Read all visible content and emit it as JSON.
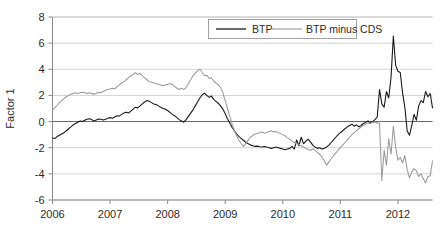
{
  "chart_data": {
    "type": "line",
    "title": "",
    "xlabel": "",
    "ylabel": "Factor 1",
    "xlim": [
      2006.0,
      2012.6
    ],
    "ylim": [
      -6,
      8
    ],
    "yticks": [
      8,
      6,
      4,
      2,
      0,
      -2,
      -4,
      -6
    ],
    "ytick_labels": [
      "8",
      "6",
      "4",
      "2",
      "0",
      "-2",
      "-4",
      "-6"
    ],
    "xticks": [
      2006,
      2007,
      2008,
      2009,
      2010,
      2011,
      2012
    ],
    "xtick_labels": [
      "2006",
      "2007",
      "2008",
      "2009",
      "2010",
      "2011",
      "2012"
    ],
    "grid": true,
    "grid_axis": "y",
    "zero_line": true,
    "legend_position": "upper center",
    "series": [
      {
        "name": "BTP",
        "color": "#1a1a1a",
        "x": [
          2006.0,
          2006.04,
          2006.08,
          2006.12,
          2006.16,
          2006.2,
          2006.24,
          2006.28,
          2006.32,
          2006.36,
          2006.4,
          2006.44,
          2006.48,
          2006.52,
          2006.56,
          2006.6,
          2006.64,
          2006.68,
          2006.72,
          2006.76,
          2006.8,
          2006.84,
          2006.88,
          2006.92,
          2006.96,
          2007.0,
          2007.04,
          2007.08,
          2007.12,
          2007.16,
          2007.2,
          2007.24,
          2007.28,
          2007.32,
          2007.36,
          2007.4,
          2007.44,
          2007.48,
          2007.52,
          2007.56,
          2007.6,
          2007.64,
          2007.68,
          2007.72,
          2007.76,
          2007.8,
          2007.84,
          2007.88,
          2007.92,
          2007.96,
          2008.0,
          2008.04,
          2008.08,
          2008.12,
          2008.16,
          2008.2,
          2008.24,
          2008.28,
          2008.32,
          2008.36,
          2008.4,
          2008.44,
          2008.48,
          2008.52,
          2008.56,
          2008.6,
          2008.64,
          2008.68,
          2008.72,
          2008.76,
          2008.8,
          2008.84,
          2008.88,
          2008.92,
          2008.96,
          2009.0,
          2009.04,
          2009.08,
          2009.12,
          2009.16,
          2009.2,
          2009.24,
          2009.28,
          2009.32,
          2009.36,
          2009.4,
          2009.44,
          2009.48,
          2009.52,
          2009.56,
          2009.6,
          2009.64,
          2009.68,
          2009.72,
          2009.76,
          2009.8,
          2009.84,
          2009.88,
          2009.92,
          2009.96,
          2010.0,
          2010.04,
          2010.08,
          2010.12,
          2010.16,
          2010.2,
          2010.24,
          2010.28,
          2010.32,
          2010.36,
          2010.4,
          2010.44,
          2010.48,
          2010.52,
          2010.56,
          2010.6,
          2010.64,
          2010.68,
          2010.72,
          2010.76,
          2010.8,
          2010.84,
          2010.88,
          2010.92,
          2010.96,
          2011.0,
          2011.04,
          2011.08,
          2011.12,
          2011.16,
          2011.2,
          2011.24,
          2011.28,
          2011.32,
          2011.36,
          2011.4,
          2011.44,
          2011.48,
          2011.52,
          2011.56,
          2011.6,
          2011.64,
          2011.68,
          2011.72,
          2011.76,
          2011.8,
          2011.84,
          2011.88,
          2011.92,
          2011.96,
          2012.0,
          2012.04,
          2012.08,
          2012.12,
          2012.16,
          2012.2,
          2012.24,
          2012.28,
          2012.32,
          2012.36,
          2012.4,
          2012.44,
          2012.48,
          2012.52,
          2012.56,
          2012.6
        ],
        "y": [
          -1.25,
          -1.3,
          -1.15,
          -1.05,
          -0.95,
          -0.85,
          -0.7,
          -0.55,
          -0.4,
          -0.25,
          -0.15,
          -0.05,
          0.05,
          0.0,
          0.1,
          0.18,
          0.22,
          0.15,
          0.05,
          0.12,
          0.2,
          0.18,
          0.12,
          0.18,
          0.25,
          0.3,
          0.25,
          0.35,
          0.45,
          0.42,
          0.55,
          0.65,
          0.72,
          0.65,
          0.8,
          0.95,
          1.1,
          1.05,
          1.2,
          1.35,
          1.5,
          1.62,
          1.55,
          1.45,
          1.35,
          1.3,
          1.2,
          1.1,
          1.0,
          0.95,
          0.85,
          0.7,
          0.55,
          0.45,
          0.3,
          0.15,
          0.05,
          -0.05,
          0.15,
          0.4,
          0.65,
          0.9,
          1.2,
          1.5,
          1.8,
          2.05,
          2.18,
          2.0,
          1.85,
          1.95,
          1.7,
          1.55,
          1.4,
          1.2,
          0.95,
          0.6,
          0.2,
          -0.1,
          -0.45,
          -0.7,
          -0.95,
          -1.15,
          -1.3,
          -1.45,
          -1.6,
          -1.7,
          -1.8,
          -1.85,
          -1.9,
          -1.88,
          -1.92,
          -1.95,
          -1.9,
          -1.95,
          -2.0,
          -2.05,
          -2.0,
          -1.95,
          -2.0,
          -2.05,
          -2.1,
          -2.15,
          -2.1,
          -2.05,
          -1.9,
          -2.1,
          -1.4,
          -1.85,
          -1.2,
          -1.7,
          -1.5,
          -1.35,
          -1.55,
          -1.8,
          -1.95,
          -2.05,
          -2.0,
          -2.1,
          -2.05,
          -1.95,
          -1.8,
          -1.6,
          -1.4,
          -1.2,
          -1.0,
          -0.85,
          -0.7,
          -0.55,
          -0.4,
          -0.3,
          -0.2,
          -0.35,
          -0.25,
          -0.4,
          -0.3,
          -0.15,
          -0.05,
          0.05,
          -0.1,
          0.0,
          0.15,
          0.35,
          2.45,
          1.35,
          1.1,
          2.3,
          1.8,
          3.4,
          6.55,
          4.3,
          3.85,
          3.75,
          2.2,
          1.1,
          -0.7,
          -1.05,
          -0.3,
          0.55,
          0.1,
          1.2,
          1.6,
          1.45,
          2.3,
          1.9,
          2.15,
          1.05
        ]
      },
      {
        "name": "BTP minus CDS",
        "color": "#9a9a9a",
        "x": [
          2006.0,
          2006.04,
          2006.08,
          2006.12,
          2006.16,
          2006.2,
          2006.24,
          2006.28,
          2006.32,
          2006.36,
          2006.4,
          2006.44,
          2006.48,
          2006.52,
          2006.56,
          2006.6,
          2006.64,
          2006.68,
          2006.72,
          2006.76,
          2006.8,
          2006.84,
          2006.88,
          2006.92,
          2006.96,
          2007.0,
          2007.04,
          2007.08,
          2007.12,
          2007.16,
          2007.2,
          2007.24,
          2007.28,
          2007.32,
          2007.36,
          2007.4,
          2007.44,
          2007.48,
          2007.52,
          2007.56,
          2007.6,
          2007.64,
          2007.68,
          2007.72,
          2007.76,
          2007.8,
          2007.84,
          2007.88,
          2007.92,
          2007.96,
          2008.0,
          2008.04,
          2008.08,
          2008.12,
          2008.16,
          2008.2,
          2008.24,
          2008.28,
          2008.32,
          2008.36,
          2008.4,
          2008.44,
          2008.48,
          2008.52,
          2008.56,
          2008.6,
          2008.64,
          2008.68,
          2008.72,
          2008.76,
          2008.8,
          2008.84,
          2008.88,
          2008.92,
          2008.96,
          2009.0,
          2009.04,
          2009.08,
          2009.12,
          2009.16,
          2009.2,
          2009.24,
          2009.28,
          2009.32,
          2009.36,
          2009.4,
          2009.44,
          2009.48,
          2009.52,
          2009.56,
          2009.6,
          2009.64,
          2009.68,
          2009.72,
          2009.76,
          2009.8,
          2009.84,
          2009.88,
          2009.92,
          2009.96,
          2010.0,
          2010.04,
          2010.08,
          2010.12,
          2010.16,
          2010.2,
          2010.24,
          2010.28,
          2010.32,
          2010.36,
          2010.4,
          2010.44,
          2010.48,
          2010.52,
          2010.56,
          2010.6,
          2010.64,
          2010.68,
          2010.72,
          2010.76,
          2010.8,
          2010.84,
          2010.88,
          2010.92,
          2010.96,
          2011.0,
          2011.04,
          2011.08,
          2011.12,
          2011.16,
          2011.2,
          2011.24,
          2011.28,
          2011.32,
          2011.36,
          2011.4,
          2011.44,
          2011.48,
          2011.52,
          2011.56,
          2011.6,
          2011.64,
          2011.68,
          2011.72,
          2011.76,
          2011.8,
          2011.84,
          2011.88,
          2011.92,
          2011.96,
          2012.0,
          2012.04,
          2012.08,
          2012.12,
          2012.16,
          2012.2,
          2012.24,
          2012.28,
          2012.32,
          2012.36,
          2012.4,
          2012.44,
          2012.48,
          2012.52,
          2012.56,
          2012.6
        ],
        "y": [
          0.9,
          1.05,
          1.25,
          1.45,
          1.6,
          1.75,
          1.9,
          2.0,
          2.1,
          2.15,
          2.2,
          2.15,
          2.2,
          2.25,
          2.2,
          2.15,
          2.2,
          2.15,
          2.1,
          2.15,
          2.25,
          2.2,
          2.3,
          2.4,
          2.45,
          2.5,
          2.55,
          2.5,
          2.65,
          2.8,
          2.95,
          3.05,
          3.2,
          3.35,
          3.5,
          3.6,
          3.75,
          3.6,
          3.7,
          3.5,
          3.35,
          3.2,
          3.05,
          3.0,
          2.95,
          2.9,
          2.85,
          2.8,
          2.75,
          2.8,
          2.85,
          2.9,
          2.85,
          2.7,
          2.55,
          2.45,
          2.55,
          2.45,
          2.6,
          2.9,
          3.2,
          3.5,
          3.7,
          3.9,
          4.0,
          3.75,
          3.5,
          3.55,
          3.3,
          3.35,
          3.1,
          2.95,
          2.8,
          2.6,
          2.2,
          1.6,
          1.0,
          0.4,
          -0.2,
          -0.7,
          -1.1,
          -1.45,
          -1.7,
          -1.9,
          -1.65,
          -1.4,
          -1.2,
          -1.05,
          -0.95,
          -0.9,
          -0.85,
          -0.8,
          -0.9,
          -0.85,
          -0.75,
          -0.7,
          -0.8,
          -0.75,
          -0.85,
          -0.9,
          -1.0,
          -1.1,
          -1.25,
          -1.35,
          -1.5,
          -1.6,
          -1.7,
          -1.75,
          -1.85,
          -1.95,
          -2.05,
          -2.15,
          -2.2,
          -2.1,
          -2.2,
          -2.35,
          -2.5,
          -2.7,
          -3.0,
          -3.35,
          -3.1,
          -2.85,
          -2.6,
          -2.4,
          -2.2,
          -2.0,
          -1.8,
          -1.6,
          -1.4,
          -1.2,
          -1.0,
          -0.85,
          -0.7,
          -0.55,
          -0.4,
          -0.3,
          -0.2,
          -0.1,
          -0.15,
          -0.05,
          -0.05,
          -0.1,
          -0.15,
          -4.5,
          -2.2,
          -3.35,
          -1.3,
          -2.5,
          -0.35,
          -2.0,
          -2.95,
          -2.75,
          -3.15,
          -2.6,
          -3.7,
          -4.3,
          -3.85,
          -3.6,
          -3.75,
          -4.2,
          -4.0,
          -4.35,
          -4.7,
          -4.2,
          -4.15,
          -3.0
        ]
      }
    ]
  },
  "legend": {
    "entries": [
      {
        "label": "BTP",
        "color": "#1a1a1a"
      },
      {
        "label": "BTP minus CDS",
        "color": "#9a9a9a"
      }
    ]
  }
}
